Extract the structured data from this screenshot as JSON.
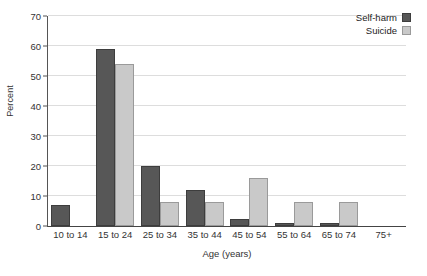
{
  "chart_data": {
    "type": "bar",
    "title": "",
    "subtitle": "",
    "xlabel": "Age (years)",
    "ylabel": "Percent",
    "categories": [
      "10 to 14",
      "15 to 24",
      "25 to 34",
      "35 to 44",
      "45 to 54",
      "55 to 64",
      "65 to 74",
      "75+"
    ],
    "series": [
      {
        "name": "Self-harm",
        "color": "#575757",
        "values": [
          7,
          59,
          20,
          12,
          2.5,
          1,
          1,
          0
        ]
      },
      {
        "name": "Suicide",
        "color": "#c9c9c9",
        "values": [
          0,
          54,
          8,
          8,
          16,
          8,
          8,
          0
        ]
      }
    ],
    "ylim": [
      0,
      70
    ],
    "yticks": [
      0,
      10,
      20,
      30,
      40,
      50,
      60,
      70
    ],
    "ytick_labels": [
      "0",
      "10",
      "20",
      "30",
      "40",
      "50",
      "60",
      "70"
    ],
    "grid": true,
    "grid_axis": "y",
    "legend_position": "top-right"
  },
  "legend": {
    "entries": [
      {
        "label": "Self-harm",
        "swatch": "self-harm"
      },
      {
        "label": "Suicide",
        "swatch": "suicide"
      }
    ]
  },
  "axes": {
    "y_title": "Percent",
    "x_title": "Age (years)"
  }
}
